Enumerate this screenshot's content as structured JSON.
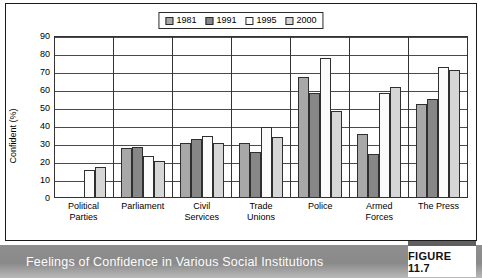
{
  "chart_data": {
    "type": "bar",
    "title": "",
    "xlabel": "",
    "ylabel": "Confident (%)",
    "ylim": [
      0,
      90
    ],
    "ytick_step": 10,
    "yticks": [
      90,
      80,
      70,
      60,
      50,
      40,
      30,
      20,
      10,
      0
    ],
    "grid": true,
    "legend_position": "top-center",
    "categories": [
      "Political Parties",
      "Parliament",
      "Civil Services",
      "Trade Unions",
      "Police",
      "Armed Forces",
      "The Press"
    ],
    "category_lines": [
      [
        "Political",
        "Parties"
      ],
      [
        "Parliament",
        ""
      ],
      [
        "Civil",
        "Services"
      ],
      [
        "Trade",
        "Unions"
      ],
      [
        "Police",
        ""
      ],
      [
        "Armed",
        "Forces"
      ],
      [
        "The Press",
        ""
      ]
    ],
    "series": [
      {
        "name": "1981",
        "color": "#a8a8a8",
        "values": [
          null,
          27,
          30,
          30,
          66.5,
          35,
          51.5
        ]
      },
      {
        "name": "1991",
        "color": "#878787",
        "values": [
          null,
          28,
          32.5,
          25,
          58,
          24,
          54.5
        ]
      },
      {
        "name": "1995",
        "color": "#fbfbfb",
        "values": [
          15,
          23,
          34,
          39,
          77,
          58,
          72
        ]
      },
      {
        "name": "2000",
        "color": "#d6d6d6",
        "values": [
          16.5,
          20,
          30,
          33.5,
          48,
          61,
          70.5
        ]
      }
    ]
  },
  "caption": {
    "text": "Feelings of Confidence in Various Social Institutions",
    "figure_label": "FIGURE 11.7"
  },
  "colors": {
    "band": "#8e8e8e",
    "frame": "#1a1a1a",
    "grid": "#4a4a4a"
  }
}
